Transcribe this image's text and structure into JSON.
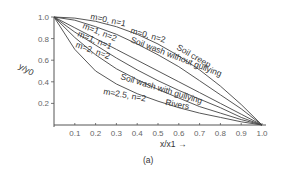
{
  "chart_data": {
    "type": "line",
    "title": "",
    "panel_label": "(a)",
    "xlabel": "x/x1 →",
    "ylabel": "y/y0",
    "xlim": [
      0,
      1.0
    ],
    "ylim": [
      0,
      1.0
    ],
    "x_ticks": [
      "0.1",
      "0.2",
      "0.3",
      "0.4",
      "0.5",
      "0.6",
      "0.7",
      "0.8",
      "0.9",
      "1.0"
    ],
    "y_ticks": [
      "0.2",
      "0.4",
      "0.6",
      "0.8",
      "1.0"
    ],
    "grid": false,
    "x": [
      0,
      0.1,
      0.2,
      0.3,
      0.4,
      0.5,
      0.6,
      0.7,
      0.8,
      0.9,
      1.0
    ],
    "series": [
      {
        "name": "m=0, n=1",
        "values": [
          1.0,
          0.99,
          0.96,
          0.91,
          0.84,
          0.75,
          0.64,
          0.51,
          0.36,
          0.19,
          0.0
        ]
      },
      {
        "name": "m=0, n=2",
        "values": [
          1.0,
          0.97,
          0.91,
          0.84,
          0.75,
          0.65,
          0.54,
          0.41,
          0.28,
          0.15,
          0.0
        ]
      },
      {
        "name": "m=1, n=2",
        "values": [
          1.0,
          0.9,
          0.8,
          0.7,
          0.6,
          0.5,
          0.4,
          0.3,
          0.2,
          0.1,
          0.0
        ]
      },
      {
        "name": "m=1, n=1",
        "values": [
          1.0,
          0.86,
          0.74,
          0.62,
          0.51,
          0.41,
          0.32,
          0.24,
          0.16,
          0.07,
          0.0
        ]
      },
      {
        "name": "m=2, n=2",
        "values": [
          1.0,
          0.81,
          0.65,
          0.52,
          0.42,
          0.33,
          0.25,
          0.17,
          0.11,
          0.05,
          0.0
        ]
      },
      {
        "name": "m=2.5, n=2",
        "values": [
          1.0,
          0.7,
          0.5,
          0.38,
          0.29,
          0.22,
          0.16,
          0.11,
          0.07,
          0.03,
          0.0
        ]
      }
    ],
    "annotations": [
      "Soil creep",
      "Soil wash without gullying",
      "Soil wash with gullying",
      "Rivers"
    ]
  }
}
